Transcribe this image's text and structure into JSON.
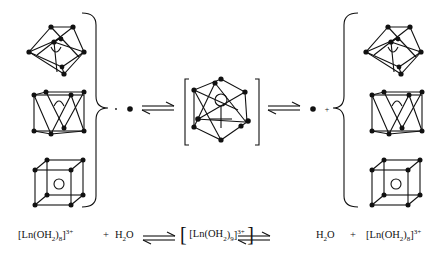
{
  "diagram": {
    "type": "equilibrium-scheme",
    "left_group": {
      "structures": [
        "tricapped-trigonal-prism",
        "square-antiprism",
        "cube"
      ],
      "bracket": "curly-right"
    },
    "center": {
      "structure": "tricapped-trigonal-prism-9-coordinate",
      "bracket": "square"
    },
    "right_group": {
      "structures": [
        "tricapped-trigonal-prism",
        "square-antiprism",
        "cube"
      ],
      "bracket": "curly-left"
    },
    "small_symbols": {
      "left_dot_label": "·",
      "right_plus_label": "+"
    },
    "colors": {
      "ink": "#111111",
      "background": "#ffffff"
    }
  },
  "equation": {
    "reactant_complex": {
      "base": "[Ln(OH",
      "sub1": "2",
      "mid": ")",
      "sub2": "8",
      "close": "]",
      "charge": "3+"
    },
    "plus1": "+",
    "water1": {
      "base": "H",
      "sub": "2",
      "tail": "O"
    },
    "intermediate": {
      "open": "[",
      "base": "[Ln(OH",
      "sub1": "2",
      "mid": ")",
      "sub2": "9",
      "close": "]",
      "charge": "3+",
      "outer_close": "]"
    },
    "water2": {
      "base": "H",
      "sub": "2",
      "tail": "O"
    },
    "plus2": "+",
    "product_complex": {
      "base": "[Ln(OH",
      "sub1": "2",
      "mid": ")",
      "sub2": "8",
      "close": "]",
      "charge": "3+"
    }
  }
}
